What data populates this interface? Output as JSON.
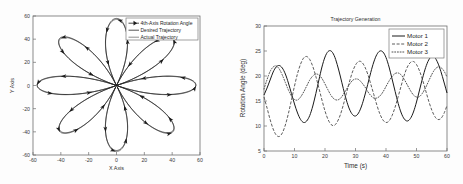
{
  "figure": {
    "background": "#fdfdfd",
    "panels": [
      "trajectory-xy-plot",
      "trajectory-generation-plot"
    ]
  },
  "left_panel": {
    "legend": [
      {
        "label": "4th-Axis Rotation Angle",
        "style": "line-with-arrow-markers"
      },
      {
        "label": "Desired Trajectory",
        "style": "solid-line"
      },
      {
        "label": "Actual Trajectory",
        "style": "solid-line-light"
      }
    ]
  },
  "right_panel": {
    "legend": [
      {
        "label": "Motor 1",
        "style": "solid"
      },
      {
        "label": "Motor 2",
        "style": "dashed"
      },
      {
        "label": "Motor 3",
        "style": "dotted"
      }
    ]
  },
  "chart_data": [
    {
      "type": "line",
      "name": "xy-rosette-trajectory",
      "title": "",
      "xlabel": "X Axis",
      "ylabel": "Y Axis",
      "xlim": [
        -60,
        60
      ],
      "ylim": [
        -60,
        60
      ],
      "xticks": [
        -60,
        -40,
        -20,
        0,
        20,
        40,
        60
      ],
      "xticklabels": [
        "-60",
        "-40",
        "-20",
        "0",
        "20",
        "40",
        "60"
      ],
      "yticks": [
        -60,
        -40,
        -20,
        0,
        20,
        40,
        60
      ],
      "yticklabels": [
        "-60",
        "-40",
        "-20",
        "0",
        "20",
        "40",
        "60"
      ],
      "grid": false,
      "legend_position": "upper-right",
      "description": "Eight-petal rose curve r = R*cos(4*theta) style rosette traced twice (desired and actual), with arrow markers along each petal indicating the 4th-axis rotation angle direction.",
      "petals": 8,
      "petal_radius": 57,
      "petal_angles_deg": [
        0,
        45,
        90,
        135,
        180,
        225,
        270,
        315
      ],
      "series": [
        {
          "name": "4th-Axis Rotation Angle",
          "marker": "arrow",
          "values": "arrow markers along petals"
        },
        {
          "name": "Desired Trajectory",
          "marker": "none",
          "values": "rosette, 8 petals, radius 57"
        },
        {
          "name": "Actual Trajectory",
          "marker": "none",
          "values": "rosette, 8 petals, radius 57, slight offset"
        }
      ]
    },
    {
      "type": "line",
      "name": "trajectory-generation",
      "title": "Trajectory Generation",
      "xlabel": "Time (s)",
      "ylabel": "Rotation Angle (deg)",
      "xlim": [
        0,
        60
      ],
      "ylim": [
        5,
        30
      ],
      "xticks": [
        0,
        10,
        20,
        30,
        40,
        50,
        60
      ],
      "xticklabels": [
        "0",
        "10",
        "20",
        "30",
        "40",
        "50",
        "60"
      ],
      "yticks": [
        5,
        10,
        15,
        20,
        25,
        30
      ],
      "yticklabels": [
        "5",
        "10",
        "15",
        "20",
        "25",
        "30"
      ],
      "grid": false,
      "legend_position": "upper-right",
      "x": [
        0,
        1,
        2,
        3,
        4,
        5,
        6,
        7,
        8,
        9,
        10,
        11,
        12,
        13,
        14,
        15,
        16,
        17,
        18,
        19,
        20,
        21,
        22,
        23,
        24,
        25,
        26,
        27,
        28,
        29,
        30,
        31,
        32,
        33,
        34,
        35,
        36,
        37,
        38,
        39,
        40,
        41,
        42,
        43,
        44,
        45,
        46,
        47,
        48,
        49,
        50,
        51,
        52,
        53,
        54,
        55,
        56,
        57,
        58,
        59,
        60
      ],
      "series": [
        {
          "name": "Motor 1",
          "linestyle": "solid",
          "color": "#1a1a1a",
          "values": [
            16.2,
            17.6,
            19.2,
            20.8,
            21.8,
            22.1,
            21.6,
            20.4,
            18.6,
            16.5,
            14.4,
            12.6,
            11.3,
            10.7,
            11.0,
            12.1,
            14.0,
            16.5,
            19.2,
            21.8,
            23.8,
            24.9,
            25.0,
            24.1,
            22.3,
            20.0,
            17.5,
            15.2,
            13.4,
            12.3,
            12.0,
            12.6,
            14.0,
            16.0,
            18.3,
            20.7,
            22.8,
            24.3,
            25.0,
            24.8,
            23.7,
            21.8,
            19.4,
            16.9,
            14.5,
            12.6,
            11.4,
            11.0,
            11.5,
            12.8,
            14.8,
            17.2,
            19.6,
            21.7,
            23.2,
            23.9,
            23.7,
            22.6,
            20.9,
            18.8,
            16.6
          ]
        },
        {
          "name": "Motor 2",
          "linestyle": "dashed",
          "color": "#4a4a4a",
          "values": [
            15.8,
            13.6,
            11.3,
            9.4,
            8.2,
            7.9,
            8.6,
            10.2,
            12.5,
            15.2,
            18.0,
            20.5,
            22.4,
            23.6,
            23.9,
            23.3,
            21.9,
            19.9,
            17.6,
            15.2,
            13.0,
            11.3,
            10.3,
            10.1,
            10.8,
            12.2,
            14.2,
            16.5,
            18.8,
            20.8,
            22.2,
            22.9,
            22.8,
            21.9,
            20.4,
            18.4,
            16.3,
            14.2,
            12.4,
            11.2,
            10.7,
            11.0,
            12.1,
            13.8,
            15.9,
            18.1,
            20.2,
            21.8,
            22.7,
            22.9,
            22.3,
            21.0,
            19.2,
            17.1,
            15.0,
            13.2,
            11.9,
            11.3,
            11.5,
            12.5,
            14.1
          ]
        },
        {
          "name": "Motor 3",
          "linestyle": "dotted",
          "color": "#3c3c3c",
          "values": [
            17.4,
            19.3,
            20.9,
            21.8,
            22.0,
            21.4,
            20.2,
            18.7,
            17.2,
            16.0,
            15.3,
            15.2,
            15.8,
            16.8,
            18.0,
            19.2,
            20.0,
            20.4,
            20.2,
            19.5,
            18.4,
            17.2,
            16.1,
            15.4,
            15.2,
            15.5,
            16.3,
            17.3,
            18.3,
            19.1,
            19.4,
            19.3,
            18.7,
            17.9,
            16.9,
            16.1,
            15.6,
            15.6,
            16.0,
            16.8,
            17.9,
            19.0,
            19.9,
            20.5,
            20.6,
            20.2,
            19.3,
            18.2,
            17.1,
            16.2,
            15.8,
            15.9,
            16.6,
            17.7,
            19.0,
            20.3,
            21.3,
            21.8,
            21.7,
            21.0,
            19.8
          ]
        }
      ]
    }
  ]
}
